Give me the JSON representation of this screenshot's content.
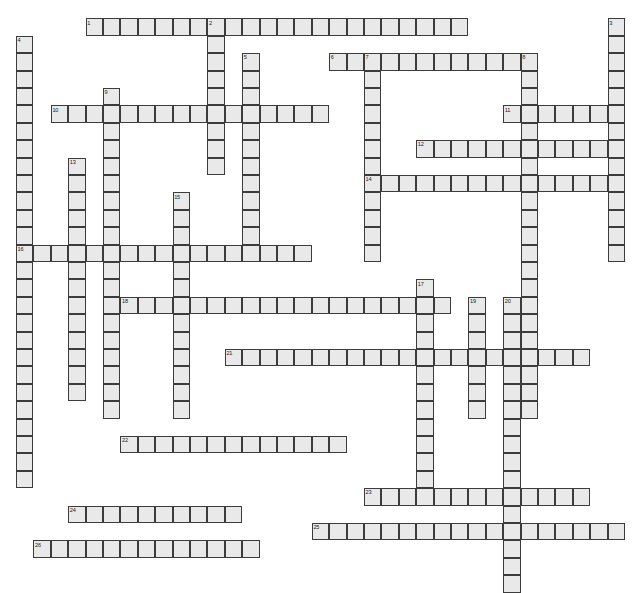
{
  "puzzle": {
    "title": "",
    "width_px": 634,
    "height_px": 577,
    "cell_size_px": 17.4,
    "origin_x_px": 16,
    "origin_y_px": 1,
    "colors": {
      "cell_fill": "#e9e9e9",
      "cell_border": "#3c3c3c",
      "page_background": "#ffffff",
      "number_text": "#1a1a1a"
    },
    "total_entries": 26,
    "entries": [
      {
        "number": 1,
        "direction": "across",
        "col": 4,
        "row": 1,
        "length": 22
      },
      {
        "number": 2,
        "direction": "down",
        "col": 11,
        "row": 1,
        "length": 9
      },
      {
        "number": 3,
        "direction": "down",
        "col": 34,
        "row": 1,
        "length": 14
      },
      {
        "number": 4,
        "direction": "down",
        "col": 0,
        "row": 2,
        "length": 26
      },
      {
        "number": 5,
        "direction": "down",
        "col": 13,
        "row": 3,
        "length": 12
      },
      {
        "number": 6,
        "direction": "across",
        "col": 18,
        "row": 3,
        "length": 11
      },
      {
        "number": 7,
        "direction": "down",
        "col": 20,
        "row": 3,
        "length": 12
      },
      {
        "number": 8,
        "direction": "down",
        "col": 29,
        "row": 3,
        "length": 21
      },
      {
        "number": 9,
        "direction": "down",
        "col": 5,
        "row": 5,
        "length": 19
      },
      {
        "number": 10,
        "direction": "across",
        "col": 2,
        "row": 6,
        "length": 16
      },
      {
        "number": 11,
        "direction": "across",
        "col": 28,
        "row": 6,
        "length": 7
      },
      {
        "number": 12,
        "direction": "across",
        "col": 23,
        "row": 8,
        "length": 11
      },
      {
        "number": 13,
        "direction": "down",
        "col": 3,
        "row": 9,
        "length": 14
      },
      {
        "number": 14,
        "direction": "across",
        "col": 20,
        "row": 10,
        "length": 14
      },
      {
        "number": 15,
        "direction": "down",
        "col": 9,
        "row": 11,
        "length": 13
      },
      {
        "number": 16,
        "direction": "across",
        "col": 0,
        "row": 14,
        "length": 17
      },
      {
        "number": 17,
        "direction": "down",
        "col": 23,
        "row": 16,
        "length": 13
      },
      {
        "number": 18,
        "direction": "across",
        "col": 6,
        "row": 17,
        "length": 19
      },
      {
        "number": 19,
        "direction": "down",
        "col": 26,
        "row": 17,
        "length": 7
      },
      {
        "number": 20,
        "direction": "down",
        "col": 28,
        "row": 17,
        "length": 17
      },
      {
        "number": 21,
        "direction": "across",
        "col": 12,
        "row": 20,
        "length": 21
      },
      {
        "number": 22,
        "direction": "across",
        "col": 6,
        "row": 25,
        "length": 13
      },
      {
        "number": 23,
        "direction": "across",
        "col": 20,
        "row": 28,
        "length": 13
      },
      {
        "number": 24,
        "direction": "across",
        "col": 3,
        "row": 29,
        "length": 10
      },
      {
        "number": 25,
        "direction": "across",
        "col": 17,
        "row": 30,
        "length": 18
      },
      {
        "number": 26,
        "direction": "across",
        "col": 1,
        "row": 31,
        "length": 13
      }
    ]
  }
}
